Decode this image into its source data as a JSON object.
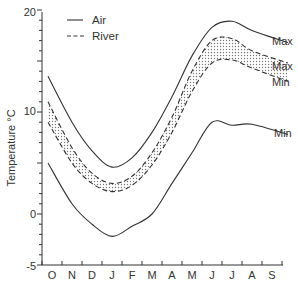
{
  "chart_data": {
    "type": "line",
    "title": "",
    "xlabel": "",
    "ylabel": "Temperature °C",
    "ylim": [
      -5,
      20
    ],
    "yticks": [
      -5,
      0,
      10,
      20
    ],
    "yminor_step": 1,
    "grid": false,
    "legend": {
      "position": "upper-left",
      "entries": [
        {
          "label": "Air",
          "style": "solid"
        },
        {
          "label": "River",
          "style": "dashed"
        }
      ]
    },
    "categories": [
      "O",
      "N",
      "D",
      "J",
      "F",
      "M",
      "A",
      "M",
      "J",
      "J",
      "A",
      "S"
    ],
    "series": [
      {
        "name": "Air Max",
        "style": "solid",
        "end_label": "Max",
        "values": [
          13.5,
          9.0,
          6.2,
          4.6,
          5.5,
          8.0,
          11.5,
          15.5,
          18.3,
          18.9,
          18.0,
          16.8
        ]
      },
      {
        "name": "River Max",
        "style": "dashed",
        "end_label": "Max",
        "values": [
          11.0,
          6.5,
          4.0,
          3.0,
          3.7,
          6.0,
          9.5,
          14.0,
          17.0,
          17.2,
          16.0,
          14.8
        ]
      },
      {
        "name": "River Min",
        "style": "dashed",
        "end_label": "Min",
        "values": [
          9.0,
          5.0,
          3.0,
          2.2,
          2.8,
          4.8,
          8.0,
          12.0,
          14.8,
          15.1,
          14.3,
          13.0
        ]
      },
      {
        "name": "Air Min",
        "style": "solid",
        "end_label": "Min",
        "values": [
          5.0,
          1.0,
          -1.0,
          -2.2,
          -1.2,
          0.0,
          3.0,
          6.0,
          9.0,
          8.7,
          8.8,
          7.8
        ]
      }
    ],
    "annotations": [
      "Shaded region between River Max and River Min"
    ]
  },
  "labels": {
    "ylabel": "Temperature °C",
    "legend_air": "Air",
    "legend_river": "River",
    "air_max": "Max",
    "river_max": "Max",
    "river_min": "Min",
    "air_min": "Min",
    "ytick_20": "20",
    "ytick_10": "10",
    "ytick_0": "0",
    "ytick_m5": "-5",
    "months": [
      "O",
      "N",
      "D",
      "J",
      "F",
      "M",
      "A",
      "M",
      "J",
      "J",
      "A",
      "S"
    ]
  }
}
